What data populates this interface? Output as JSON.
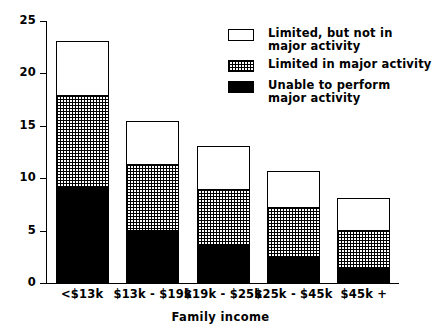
{
  "chart_data": {
    "type": "bar",
    "subtype": "stacked-bar",
    "title": "",
    "xlabel": "Family income",
    "ylabel": "Percent of population",
    "categories": [
      "<$13k",
      "$13k - $19k",
      "$19k - $25k",
      "$25k - $45k",
      "$45k +"
    ],
    "series": [
      {
        "name": "Unable to perform\nmajor activity",
        "key": "unable",
        "fill": "solid-black",
        "values": [
          9.2,
          5.0,
          3.5,
          2.5,
          1.3
        ]
      },
      {
        "name": "Limited in major activity",
        "key": "limited_major",
        "fill": "cross-hatch",
        "values": [
          8.6,
          6.3,
          5.4,
          4.7,
          3.7
        ]
      },
      {
        "name": "Limited, but not in\nmajor activity",
        "key": "limited_not_major",
        "fill": "white",
        "values": [
          5.2,
          4.1,
          4.1,
          3.4,
          3.0
        ]
      }
    ],
    "totals": [
      23.0,
      15.4,
      13.0,
      10.6,
      8.0
    ],
    "ylim": [
      0,
      25
    ],
    "yticks": [
      0,
      5,
      10,
      15,
      20,
      25
    ],
    "ytick_labels": [
      "0",
      "5",
      "10",
      "15",
      "20",
      "25"
    ],
    "grid": false,
    "legend_position": "top-right"
  },
  "axes": {
    "y_title": "Percent of population",
    "x_title": "Family income",
    "y_tick_labels": [
      "25",
      "20",
      "15",
      "10",
      "5",
      "0"
    ]
  },
  "legend": {
    "entries": [
      {
        "label": "Limited, but not in\nmajor activity",
        "swatch": "white-swatch"
      },
      {
        "label": "Limited in major activity",
        "swatch": "hatched-swatch"
      },
      {
        "label": "Unable to perform\nmajor activity",
        "swatch": "black-swatch"
      }
    ]
  },
  "colors": {
    "axis": "#000000",
    "bar_outline": "#000000",
    "segment_white": "#ffffff",
    "segment_black": "#000000",
    "background": "#ffffff"
  }
}
